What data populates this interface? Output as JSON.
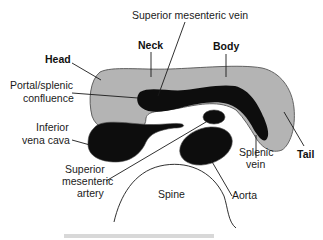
{
  "diagram": {
    "type": "anatomical cross-section",
    "colors": {
      "pancreas": "#b4b4b4",
      "vessel": "#0d0d0d",
      "outline": "#333333",
      "text": "#1a1a1a"
    },
    "labels": {
      "smv": "Superior mesenteric vein",
      "neck": "Neck",
      "body": "Body",
      "head": "Head",
      "confluence_line1": "Portal/splenic",
      "confluence_line2": "confluence",
      "ivc_line1": "Inferior",
      "ivc_line2": "vena cava",
      "sma_line1": "Superior",
      "sma_line2": "mesenteric",
      "sma_line3": "artery",
      "spine": "Spine",
      "aorta": "Aorta",
      "splenic_line1": "Splenic",
      "splenic_line2": "vein",
      "tail": "Tail"
    }
  }
}
